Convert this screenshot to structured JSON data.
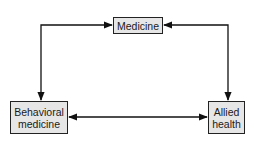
{
  "diagram": {
    "nodes": [
      {
        "id": "medicine",
        "label": "Medicine"
      },
      {
        "id": "behavioral",
        "label": "Behavioral\nmedicine"
      },
      {
        "id": "allied",
        "label": "Allied\nhealth"
      }
    ],
    "edges": [
      {
        "from": "medicine",
        "to": "behavioral",
        "type": "bidirectional"
      },
      {
        "from": "medicine",
        "to": "allied",
        "type": "bidirectional"
      },
      {
        "from": "behavioral",
        "to": "allied",
        "type": "bidirectional"
      }
    ],
    "colors": {
      "box_fill": "#e6e6e6",
      "stroke": "#222222"
    }
  }
}
